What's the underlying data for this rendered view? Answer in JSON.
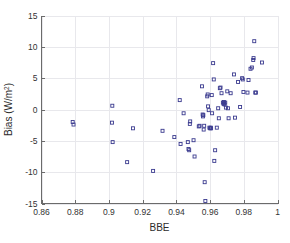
{
  "figure": {
    "background_color": "#ffffff",
    "marker_color": "#3b3b8f",
    "axis_color": "#6b6b6b",
    "grid_color": "#e8e8ec"
  },
  "chart_data": {
    "type": "scatter",
    "title": "",
    "xlabel": "BBE",
    "ylabel": "Bias (W/m2)",
    "ylabel_display": "Bias (W/m",
    "ylabel_superscript": "2",
    "ylabel_tail": ")",
    "xlim": [
      0.86,
      1.0
    ],
    "ylim": [
      -15,
      15
    ],
    "xticks": [
      0.86,
      0.88,
      0.9,
      0.92,
      0.94,
      0.96,
      0.98,
      1
    ],
    "xtick_labels": [
      "0.86",
      "0.88",
      "0.9",
      "0.92",
      "0.94",
      "0.96",
      "0.98",
      "1"
    ],
    "yticks": [
      -15,
      -10,
      -5,
      0,
      5,
      10,
      15
    ],
    "ytick_labels": [
      "-15",
      "-10",
      "-5",
      "0",
      "5",
      "10",
      "15"
    ],
    "grid": true,
    "legend": null,
    "marker_style": "open-square",
    "marker_size": 3,
    "series": [
      {
        "name": "Bias vs BBE",
        "color": "#3b3b8f",
        "points": [
          [
            0.8785,
            -2.0
          ],
          [
            0.879,
            -2.4
          ],
          [
            0.902,
            0.6
          ],
          [
            0.9018,
            -2.1
          ],
          [
            0.9022,
            -5.2
          ],
          [
            0.9108,
            -8.4
          ],
          [
            0.9143,
            -3.0
          ],
          [
            0.9262,
            -9.8
          ],
          [
            0.9318,
            -3.4
          ],
          [
            0.9388,
            -4.4
          ],
          [
            0.942,
            1.5
          ],
          [
            0.9425,
            -5.5
          ],
          [
            0.9443,
            -0.6
          ],
          [
            0.9468,
            -5.2
          ],
          [
            0.9472,
            -6.3
          ],
          [
            0.9476,
            -6.5
          ],
          [
            0.948,
            -2.3
          ],
          [
            0.9482,
            -1.9
          ],
          [
            0.9502,
            -4.9
          ],
          [
            0.9508,
            -7.5
          ],
          [
            0.9533,
            -2.7
          ],
          [
            0.9538,
            -2.6
          ],
          [
            0.9552,
            3.7
          ],
          [
            0.9556,
            -0.8
          ],
          [
            0.9558,
            -1.1
          ],
          [
            0.956,
            -0.9
          ],
          [
            0.9562,
            -3.2
          ],
          [
            0.9565,
            -2.6
          ],
          [
            0.9568,
            -11.6
          ],
          [
            0.9572,
            -14.6
          ],
          [
            0.9583,
            2.1
          ],
          [
            0.9586,
            2.4
          ],
          [
            0.9588,
            0.5
          ],
          [
            0.9592,
            -0.1
          ],
          [
            0.9596,
            -2.9
          ],
          [
            0.96,
            -3.0
          ],
          [
            0.9604,
            -2.9
          ],
          [
            0.9606,
            -3.0
          ],
          [
            0.961,
            2.3
          ],
          [
            0.9612,
            -0.6
          ],
          [
            0.9618,
            7.4
          ],
          [
            0.9622,
            4.8
          ],
          [
            0.9625,
            -8.2
          ],
          [
            0.963,
            -6.5
          ],
          [
            0.964,
            -2.9
          ],
          [
            0.9648,
            0.2
          ],
          [
            0.9652,
            -1.4
          ],
          [
            0.9658,
            3.4
          ],
          [
            0.9662,
            3.5
          ],
          [
            0.9668,
            2.6
          ],
          [
            0.9676,
            1.1
          ],
          [
            0.968,
            0.9
          ],
          [
            0.9682,
            1.2
          ],
          [
            0.9684,
            1.0
          ],
          [
            0.9686,
            0.8
          ],
          [
            0.969,
            1.1
          ],
          [
            0.9694,
            0.3
          ],
          [
            0.9702,
            2.9
          ],
          [
            0.9706,
            0.2
          ],
          [
            0.971,
            -1.4
          ],
          [
            0.9722,
            2.6
          ],
          [
            0.9742,
            5.6
          ],
          [
            0.9748,
            -1.3
          ],
          [
            0.9766,
            4.4
          ],
          [
            0.9778,
            0.4
          ],
          [
            0.979,
            5.0
          ],
          [
            0.9794,
            4.8
          ],
          [
            0.9798,
            2.8
          ],
          [
            0.9822,
            2.7
          ],
          [
            0.9828,
            4.7
          ],
          [
            0.984,
            6.5
          ],
          [
            0.9848,
            6.7
          ],
          [
            0.9856,
            7.9
          ],
          [
            0.9858,
            8.2
          ],
          [
            0.9862,
            10.9
          ],
          [
            0.9868,
            2.7
          ],
          [
            0.9872,
            2.7
          ],
          [
            0.9908,
            7.5
          ]
        ]
      }
    ]
  }
}
